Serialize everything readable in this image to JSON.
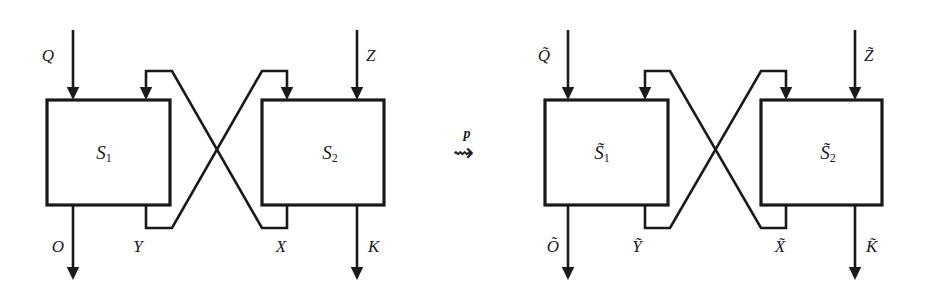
{
  "figure": {
    "kind": "block-diagram",
    "background_color": "#ffffff",
    "line_color": "#1a1a1a"
  },
  "relation": {
    "symbol": "⇝",
    "symbol_name": "rightwards-squiggle-arrow",
    "exponent": "p"
  },
  "left_system": {
    "name": "left-system",
    "blocks": [
      {
        "id": "S1",
        "base": "S",
        "subscript": "1",
        "label": "S₁"
      },
      {
        "id": "S2",
        "base": "S",
        "subscript": "2",
        "label": "S₂"
      }
    ],
    "inputs": [
      {
        "id": "Q",
        "label": "Q",
        "target_block": "S1",
        "side": "left"
      },
      {
        "id": "Y",
        "label": "Y",
        "target_block": "S1",
        "side": "right"
      },
      {
        "id": "X",
        "label": "X",
        "target_block": "S2",
        "side": "left"
      },
      {
        "id": "Z",
        "label": "Z",
        "target_block": "S2",
        "side": "right"
      }
    ],
    "outputs": [
      {
        "id": "O",
        "label": "O",
        "source_block": "S1",
        "side": "left"
      },
      {
        "id": "Y",
        "label": "Y",
        "source_block": "S1",
        "side": "right"
      },
      {
        "id": "X",
        "label": "X",
        "source_block": "S2",
        "side": "left"
      },
      {
        "id": "K",
        "label": "K",
        "source_block": "S2",
        "side": "right"
      }
    ],
    "feedback": [
      {
        "from": "S1-out-Y",
        "to": "S2-in-X",
        "label": "Y"
      },
      {
        "from": "S2-out-X",
        "to": "S1-in-Y",
        "label": "X"
      }
    ]
  },
  "right_system": {
    "name": "right-system",
    "blocks": [
      {
        "id": "S1t",
        "base": "S̃",
        "subscript": "1",
        "label": "S̃₁"
      },
      {
        "id": "S2t",
        "base": "S̃",
        "subscript": "2",
        "label": "S̃₂"
      }
    ],
    "inputs": [
      {
        "id": "Qt",
        "label": "Q̃",
        "target_block": "S1t",
        "side": "left"
      },
      {
        "id": "Yt",
        "label": "Ỹ",
        "target_block": "S1t",
        "side": "right"
      },
      {
        "id": "Xt",
        "label": "X̃",
        "target_block": "S2t",
        "side": "left"
      },
      {
        "id": "Zt",
        "label": "Z̃",
        "target_block": "S2t",
        "side": "right"
      }
    ],
    "outputs": [
      {
        "id": "Ot",
        "label": "Õ",
        "source_block": "S1t",
        "side": "left"
      },
      {
        "id": "Yt",
        "label": "Ỹ",
        "source_block": "S1t",
        "side": "right"
      },
      {
        "id": "Xt",
        "label": "X̃",
        "source_block": "S2t",
        "side": "left"
      },
      {
        "id": "Kt",
        "label": "K̃",
        "source_block": "S2t",
        "side": "right"
      }
    ],
    "feedback": [
      {
        "from": "S1t-out-Yt",
        "to": "S2t-in-Xt",
        "label": "Ỹ"
      },
      {
        "from": "S2t-out-Xt",
        "to": "S1t-in-Yt",
        "label": "X̃"
      }
    ]
  }
}
